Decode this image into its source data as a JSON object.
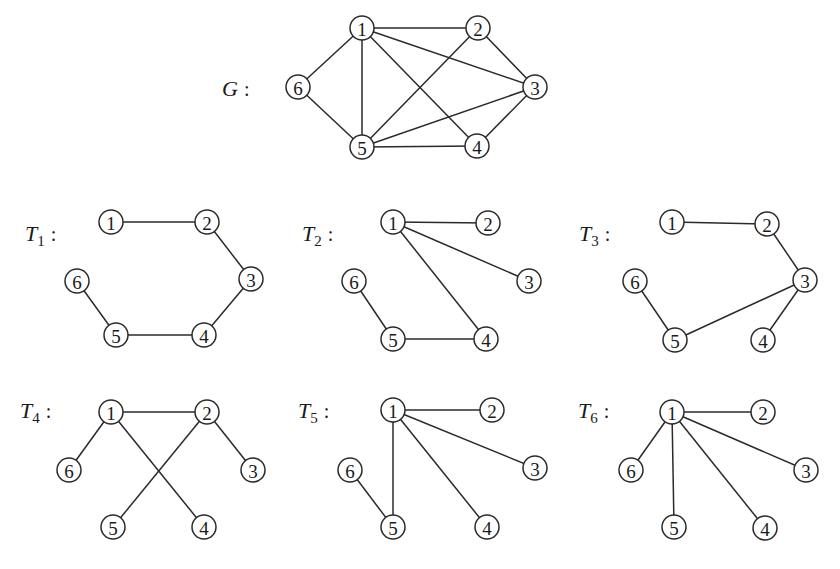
{
  "graphs": [
    {
      "id": "G",
      "label": "G",
      "subscript": "",
      "colon": ":",
      "label_pos": [
        222,
        96
      ],
      "nodes": [
        {
          "id": "1",
          "x": 362,
          "y": 28
        },
        {
          "id": "2",
          "x": 478,
          "y": 28
        },
        {
          "id": "3",
          "x": 535,
          "y": 87
        },
        {
          "id": "4",
          "x": 477,
          "y": 146
        },
        {
          "id": "5",
          "x": 362,
          "y": 147
        },
        {
          "id": "6",
          "x": 298,
          "y": 87
        }
      ],
      "edges": [
        [
          "1",
          "2"
        ],
        [
          "1",
          "3"
        ],
        [
          "1",
          "4"
        ],
        [
          "1",
          "5"
        ],
        [
          "1",
          "6"
        ],
        [
          "2",
          "3"
        ],
        [
          "2",
          "5"
        ],
        [
          "3",
          "4"
        ],
        [
          "3",
          "5"
        ],
        [
          "4",
          "5"
        ],
        [
          "5",
          "6"
        ]
      ]
    },
    {
      "id": "T1",
      "label": "T",
      "subscript": "1",
      "colon": ":",
      "label_pos": [
        25,
        241
      ],
      "nodes": [
        {
          "id": "1",
          "x": 111,
          "y": 222
        },
        {
          "id": "2",
          "x": 207,
          "y": 222
        },
        {
          "id": "3",
          "x": 251,
          "y": 279
        },
        {
          "id": "4",
          "x": 204,
          "y": 335
        },
        {
          "id": "5",
          "x": 116,
          "y": 335
        },
        {
          "id": "6",
          "x": 77,
          "y": 281
        }
      ],
      "edges": [
        [
          "1",
          "2"
        ],
        [
          "2",
          "3"
        ],
        [
          "3",
          "4"
        ],
        [
          "4",
          "5"
        ],
        [
          "5",
          "6"
        ]
      ]
    },
    {
      "id": "T2",
      "label": "T",
      "subscript": "2",
      "colon": ":",
      "label_pos": [
        302,
        241
      ],
      "nodes": [
        {
          "id": "1",
          "x": 393,
          "y": 222
        },
        {
          "id": "2",
          "x": 488,
          "y": 223
        },
        {
          "id": "3",
          "x": 529,
          "y": 281
        },
        {
          "id": "4",
          "x": 486,
          "y": 339
        },
        {
          "id": "5",
          "x": 393,
          "y": 339
        },
        {
          "id": "6",
          "x": 354,
          "y": 281
        }
      ],
      "edges": [
        [
          "1",
          "2"
        ],
        [
          "1",
          "3"
        ],
        [
          "1",
          "4"
        ],
        [
          "4",
          "5"
        ],
        [
          "5",
          "6"
        ]
      ]
    },
    {
      "id": "T3",
      "label": "T",
      "subscript": "3",
      "colon": ":",
      "label_pos": [
        579,
        241
      ],
      "nodes": [
        {
          "id": "1",
          "x": 672,
          "y": 222
        },
        {
          "id": "2",
          "x": 767,
          "y": 224
        },
        {
          "id": "3",
          "x": 805,
          "y": 280
        },
        {
          "id": "4",
          "x": 763,
          "y": 340
        },
        {
          "id": "5",
          "x": 675,
          "y": 340
        },
        {
          "id": "6",
          "x": 635,
          "y": 281
        }
      ],
      "edges": [
        [
          "1",
          "2"
        ],
        [
          "2",
          "3"
        ],
        [
          "3",
          "4"
        ],
        [
          "3",
          "5"
        ],
        [
          "5",
          "6"
        ]
      ]
    },
    {
      "id": "T4",
      "label": "T",
      "subscript": "4",
      "colon": ":",
      "label_pos": [
        20,
        418
      ],
      "nodes": [
        {
          "id": "1",
          "x": 111,
          "y": 412
        },
        {
          "id": "2",
          "x": 207,
          "y": 412
        },
        {
          "id": "3",
          "x": 253,
          "y": 470
        },
        {
          "id": "4",
          "x": 204,
          "y": 527
        },
        {
          "id": "5",
          "x": 113,
          "y": 527
        },
        {
          "id": "6",
          "x": 69,
          "y": 470
        }
      ],
      "edges": [
        [
          "1",
          "2"
        ],
        [
          "1",
          "6"
        ],
        [
          "1",
          "4"
        ],
        [
          "2",
          "5"
        ],
        [
          "2",
          "3"
        ]
      ]
    },
    {
      "id": "T5",
      "label": "T",
      "subscript": "5",
      "colon": ":",
      "label_pos": [
        298,
        418
      ],
      "nodes": [
        {
          "id": "1",
          "x": 393,
          "y": 410
        },
        {
          "id": "2",
          "x": 492,
          "y": 410
        },
        {
          "id": "3",
          "x": 535,
          "y": 468
        },
        {
          "id": "4",
          "x": 487,
          "y": 527
        },
        {
          "id": "5",
          "x": 393,
          "y": 527
        },
        {
          "id": "6",
          "x": 350,
          "y": 470
        }
      ],
      "edges": [
        [
          "1",
          "2"
        ],
        [
          "1",
          "3"
        ],
        [
          "1",
          "4"
        ],
        [
          "1",
          "5"
        ],
        [
          "5",
          "6"
        ]
      ]
    },
    {
      "id": "T6",
      "label": "T",
      "subscript": "6",
      "colon": ":",
      "label_pos": [
        578,
        418
      ],
      "nodes": [
        {
          "id": "1",
          "x": 672,
          "y": 412
        },
        {
          "id": "2",
          "x": 763,
          "y": 412
        },
        {
          "id": "3",
          "x": 806,
          "y": 470
        },
        {
          "id": "4",
          "x": 765,
          "y": 528
        },
        {
          "id": "5",
          "x": 674,
          "y": 527
        },
        {
          "id": "6",
          "x": 631,
          "y": 470
        }
      ],
      "edges": [
        [
          "1",
          "2"
        ],
        [
          "1",
          "3"
        ],
        [
          "1",
          "4"
        ],
        [
          "1",
          "5"
        ],
        [
          "1",
          "6"
        ]
      ]
    }
  ],
  "style": {
    "line_color": "#2a2a2a",
    "node_radius": 12
  }
}
